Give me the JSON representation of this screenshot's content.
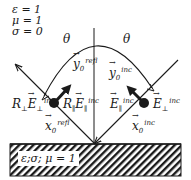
{
  "upper_medium": {
    "lines": [
      "ε = 1",
      "μ = 1",
      "σ = 0"
    ]
  },
  "lower_medium": {
    "label": "ε;σ; μ = 1"
  },
  "angles": {
    "left": "θ",
    "right": "θ"
  },
  "vectors": {
    "y_refl": {
      "base": "y",
      "sub": "0",
      "sup": "refl"
    },
    "y_inc": {
      "base": "y",
      "sub": "0",
      "sup": "inc"
    },
    "x_refl": {
      "base": "x",
      "sub": "0",
      "sup": "refl"
    },
    "x_inc": {
      "base": "x",
      "sub": "0",
      "sup": "inc"
    }
  },
  "fields": {
    "refl_perp": {
      "coef": "R",
      "coef_sub": "⊥",
      "base": "E",
      "sub": "⊥",
      "sup": "inc"
    },
    "refl_par": {
      "coef": "R",
      "coef_sub": "∥",
      "base": "E",
      "sub": "∥",
      "sup": "inc"
    },
    "inc_par": {
      "base": "E",
      "sub": "∥",
      "sup": "inc"
    },
    "inc_perp": {
      "base": "E",
      "sub": "⊥",
      "sup": "inc"
    }
  },
  "colors": {
    "ink": "#1a1a1a",
    "background": "#ffffff"
  }
}
